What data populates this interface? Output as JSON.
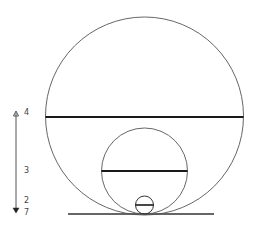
{
  "diagram": {
    "colors": {
      "background": "#ffffff",
      "stroke": "#555555",
      "thick_stroke": "#1a1a1a"
    },
    "baseline": {
      "x1": 68,
      "x2": 214,
      "y": 214
    },
    "circles": [
      {
        "name": "large-circle",
        "cx": 144.5,
        "cy": 116,
        "r": 99,
        "diameter_line_y": 117
      },
      {
        "name": "medium-circle",
        "cx": 144.5,
        "cy": 171,
        "r": 43,
        "diameter_line_y": 171
      },
      {
        "name": "small-circle",
        "cx": 144.5,
        "cy": 205,
        "r": 9,
        "diameter_line_y": 205
      }
    ],
    "scale_arrow": {
      "x": 16,
      "y_top": 111,
      "y_bottom": 213,
      "labels": [
        {
          "text": "4",
          "y": 113
        },
        {
          "text": "3",
          "y": 171
        },
        {
          "text": "2",
          "y": 201
        },
        {
          "text": "7",
          "y": 213
        }
      ]
    }
  }
}
